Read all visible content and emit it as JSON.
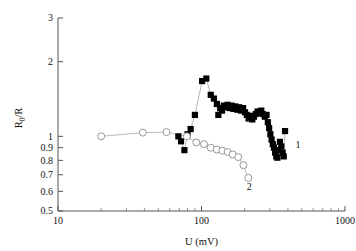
{
  "chart_data": {
    "type": "scatter",
    "title": "",
    "xlabel": "U (mV)",
    "ylabel": "R0/R",
    "ylabel_parts": {
      "base": "R",
      "sub": "0",
      "tail": "/R"
    },
    "xscale": "log",
    "yscale": "log",
    "xlim": [
      10,
      1000
    ],
    "ylim": [
      0.5,
      3
    ],
    "grid": false,
    "legend_position": "inline-right",
    "xticks": [
      10,
      100,
      1000
    ],
    "xtick_labels": [
      "10",
      "100",
      "1000"
    ],
    "yticks": [
      0.5,
      0.6,
      0.7,
      0.8,
      0.9,
      1,
      2,
      3
    ],
    "ytick_labels": [
      "0.5",
      "0.6",
      "0.7",
      "0.8",
      "0.9",
      "1",
      "2",
      "3"
    ],
    "series": [
      {
        "name": "1",
        "marker": "filled-square",
        "color": "#000000",
        "label": "1",
        "label_x": 470,
        "label_y": 0.93,
        "connected": true,
        "points": [
          [
            69,
            1.0
          ],
          [
            72,
            0.955
          ],
          [
            76,
            0.88
          ],
          [
            80,
            1.02
          ],
          [
            84,
            1.07
          ],
          [
            90,
            1.22
          ],
          [
            101,
            1.67
          ],
          [
            108,
            1.71
          ],
          [
            116,
            1.47
          ],
          [
            122,
            1.42
          ],
          [
            128,
            1.35
          ],
          [
            131,
            1.22
          ],
          [
            135,
            1.3
          ],
          [
            139,
            1.27
          ],
          [
            143,
            1.33
          ],
          [
            148,
            1.31
          ],
          [
            152,
            1.34
          ],
          [
            157,
            1.3
          ],
          [
            162,
            1.33
          ],
          [
            167,
            1.29
          ],
          [
            172,
            1.32
          ],
          [
            178,
            1.28
          ],
          [
            183,
            1.31
          ],
          [
            189,
            1.27
          ],
          [
            195,
            1.3
          ],
          [
            201,
            1.25
          ],
          [
            207,
            1.22
          ],
          [
            213,
            1.18
          ],
          [
            219,
            1.21
          ],
          [
            226,
            1.17
          ],
          [
            232,
            1.2
          ],
          [
            239,
            1.23
          ],
          [
            246,
            1.26
          ],
          [
            253,
            1.24
          ],
          [
            261,
            1.27
          ],
          [
            268,
            1.23
          ],
          [
            276,
            1.2
          ],
          [
            284,
            1.22
          ],
          [
            290,
            1.14
          ],
          [
            296,
            1.08
          ],
          [
            302,
            1.02
          ],
          [
            308,
            0.97
          ],
          [
            314,
            0.93
          ],
          [
            320,
            0.9
          ],
          [
            326,
            0.86
          ],
          [
            332,
            0.83
          ],
          [
            338,
            0.82
          ],
          [
            345,
            0.88
          ],
          [
            352,
            0.95
          ],
          [
            360,
            0.91
          ],
          [
            368,
            0.86
          ],
          [
            374,
            0.83
          ],
          [
            382,
            1.05
          ]
        ]
      },
      {
        "name": "2",
        "marker": "open-circle",
        "color": "#8d8d8d",
        "label": "2",
        "label_x": 215,
        "label_y": 0.625,
        "connected": true,
        "points": [
          [
            20,
            1.0
          ],
          [
            39,
            1.035
          ],
          [
            57,
            1.04
          ],
          [
            79,
            1.0
          ],
          [
            92,
            0.945
          ],
          [
            104,
            0.93
          ],
          [
            116,
            0.9
          ],
          [
            128,
            0.885
          ],
          [
            140,
            0.875
          ],
          [
            152,
            0.865
          ],
          [
            165,
            0.845
          ],
          [
            180,
            0.825
          ],
          [
            196,
            0.765
          ],
          [
            212,
            0.68
          ]
        ]
      }
    ]
  }
}
